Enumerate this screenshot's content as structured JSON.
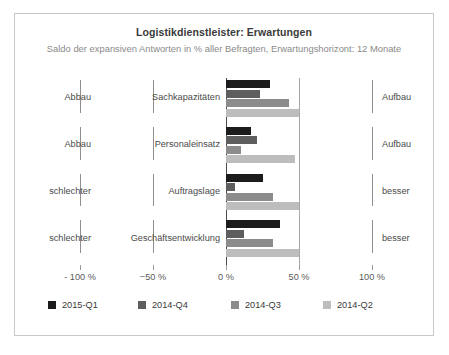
{
  "chart_data": {
    "type": "bar",
    "orientation": "horizontal",
    "title": "Logistikdienstleister: Erwartungen",
    "subtitle": "Saldo der expansiven Antworten in % aller Befragten, Erwartungshorizont: 12 Monate",
    "xlabel": "",
    "ylabel": "",
    "xlim": [
      -100,
      100
    ],
    "xticks": [
      -100,
      -50,
      0,
      50,
      100
    ],
    "xtick_labels": [
      "- 100 %",
      "−50 %",
      "0 %",
      "50 %",
      "100 %"
    ],
    "grid": true,
    "legend_position": "bottom",
    "categories": [
      "Sachkapazitäten",
      "Personaleinsatz",
      "Auftragslage",
      "Geschäftsentwicklung"
    ],
    "left_labels": [
      "Abbau",
      "Abbau",
      "schlechter",
      "schlechter"
    ],
    "right_labels": [
      "Aufbau",
      "Aufbau",
      "besser",
      "besser"
    ],
    "series": [
      {
        "name": "2015-Q1",
        "color": "#1c1c1c",
        "values": [
          30,
          17,
          25,
          37
        ]
      },
      {
        "name": "2014-Q4",
        "color": "#5e5e5e",
        "values": [
          23,
          21,
          6,
          12
        ]
      },
      {
        "name": "2014-Q3",
        "color": "#8c8c8c",
        "values": [
          43,
          10,
          32,
          32
        ]
      },
      {
        "name": "2014-Q2",
        "color": "#bdbdbd",
        "values": [
          50,
          47,
          50,
          50
        ]
      }
    ]
  },
  "legend": {
    "items": [
      {
        "label": "2015-Q1",
        "color": "#1c1c1c"
      },
      {
        "label": "2014-Q4",
        "color": "#5e5e5e"
      },
      {
        "label": "2014-Q3",
        "color": "#8c8c8c"
      },
      {
        "label": "2014-Q2",
        "color": "#bdbdbd"
      }
    ]
  },
  "colors": {
    "frame": "#c8c8c8",
    "title": "#3a3a3a",
    "subtitle": "#8a8a8a",
    "axis": "#9a9a9a",
    "zero_axis": "#4a4a4a",
    "background": "#ffffff"
  }
}
